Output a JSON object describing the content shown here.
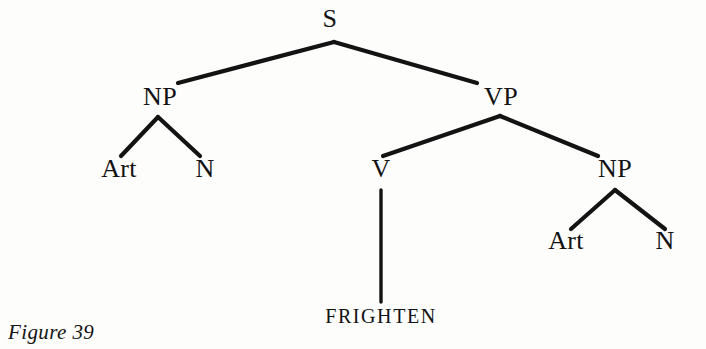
{
  "figure": {
    "caption": "Figure 39",
    "caption_x": 8,
    "caption_y": 322,
    "background_color": "#fdfdfc",
    "ink_color": "#131313",
    "width": 706,
    "height": 349
  },
  "diagram": {
    "type": "syntax-tree",
    "sentence_terminals": [
      "FRIGHTEN"
    ],
    "nodes": [
      {
        "id": "S",
        "label": "S",
        "x": 330,
        "y": 32,
        "kind": "nonterminal"
      },
      {
        "id": "NP1",
        "label": "NP",
        "x": 160,
        "y": 110,
        "kind": "nonterminal"
      },
      {
        "id": "VP",
        "label": "VP",
        "x": 501,
        "y": 110,
        "kind": "nonterminal"
      },
      {
        "id": "Art1",
        "label": "Art",
        "x": 119,
        "y": 182,
        "kind": "preterminal"
      },
      {
        "id": "N1",
        "label": "N",
        "x": 205,
        "y": 182,
        "kind": "preterminal"
      },
      {
        "id": "V",
        "label": "V",
        "x": 381,
        "y": 182,
        "kind": "preterminal"
      },
      {
        "id": "NP2",
        "label": "NP",
        "x": 615,
        "y": 182,
        "kind": "nonterminal"
      },
      {
        "id": "Art2",
        "label": "Art",
        "x": 566,
        "y": 254,
        "kind": "preterminal"
      },
      {
        "id": "N2",
        "label": "N",
        "x": 665,
        "y": 254,
        "kind": "preterminal"
      }
    ],
    "terminals": [
      {
        "id": "FRIGHTEN",
        "label": "FRIGHTEN",
        "x": 381,
        "y": 326
      }
    ],
    "edges": [
      {
        "id": "S-NP1",
        "from": "S",
        "to": "NP1",
        "x1": 334,
        "y1": 42,
        "x2": 178,
        "y2": 83,
        "width": 4.2
      },
      {
        "id": "S-VP",
        "from": "S",
        "to": "VP",
        "x1": 334,
        "y1": 42,
        "x2": 477,
        "y2": 83,
        "width": 4.2
      },
      {
        "id": "NP1-Art",
        "from": "NP1",
        "to": "Art1",
        "x1": 158,
        "y1": 117,
        "x2": 121,
        "y2": 156,
        "width": 4.2
      },
      {
        "id": "NP1-N",
        "from": "NP1",
        "to": "N1",
        "x1": 158,
        "y1": 117,
        "x2": 200,
        "y2": 156,
        "width": 4.2
      },
      {
        "id": "VP-V",
        "from": "VP",
        "to": "V",
        "x1": 500,
        "y1": 116,
        "x2": 383,
        "y2": 156,
        "width": 4.2
      },
      {
        "id": "VP-NP2",
        "from": "VP",
        "to": "NP2",
        "x1": 500,
        "y1": 116,
        "x2": 598,
        "y2": 156,
        "width": 4.2
      },
      {
        "id": "V-FRIGHTEN",
        "from": "V",
        "to": "FRIGHTEN",
        "x1": 381,
        "y1": 190,
        "x2": 381,
        "y2": 302,
        "width": 3.4
      },
      {
        "id": "NP2-Art",
        "from": "NP2",
        "to": "Art2",
        "x1": 615,
        "y1": 190,
        "x2": 571,
        "y2": 229,
        "width": 4.2
      },
      {
        "id": "NP2-N",
        "from": "NP2",
        "to": "N2",
        "x1": 615,
        "y1": 190,
        "x2": 665,
        "y2": 229,
        "width": 4.2
      }
    ]
  }
}
